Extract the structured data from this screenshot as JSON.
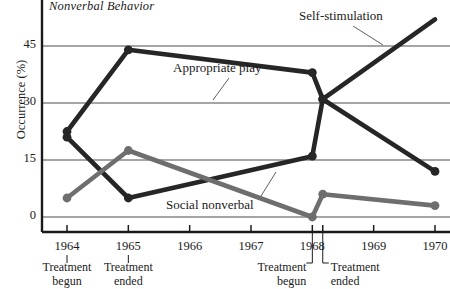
{
  "chart_data": {
    "type": "line",
    "title": "Nonverbal Behavior",
    "xlabel": "",
    "ylabel": "Occurrence (%)",
    "ylim": [
      0,
      52
    ],
    "yticks": [
      0,
      15,
      30,
      45
    ],
    "ytick_labels": [
      "0",
      "15",
      "30",
      "45"
    ],
    "xlim": [
      1963.6,
      1970.3
    ],
    "x": [
      1964,
      1965,
      1968,
      1968.17,
      1970
    ],
    "xticks": [
      1964,
      1965,
      1966,
      1967,
      1968,
      1968.17,
      1969,
      1970
    ],
    "xtick_labels": [
      "1964",
      "1965",
      "1966",
      "1967",
      "1968",
      "",
      "1969",
      "1970"
    ],
    "grid": true,
    "legend": "inline-annotations",
    "series": [
      {
        "name": "Appropriate play",
        "color": "#262626",
        "x": [
          1964,
          1965,
          1968,
          1968.17,
          1970
        ],
        "values": [
          22.5,
          44.0,
          38.0,
          31.0,
          12.0
        ],
        "label_x": 1966.0,
        "label_y": 41.0
      },
      {
        "name": "Self-stimulation",
        "color": "#262626",
        "x": [
          1964,
          1965,
          1968,
          1968.17,
          1970
        ],
        "values": [
          21.0,
          5.0,
          16.0,
          31.0,
          52.0
        ],
        "label_x": 1967.3,
        "label_y": 50.5
      },
      {
        "name": "Social nonverbal",
        "color": "#6e6e6e",
        "x": [
          1964,
          1965,
          1968,
          1968.17,
          1970
        ],
        "values": [
          5.0,
          17.5,
          0.0,
          6.0,
          3.0
        ],
        "label_x": 1965.8,
        "label_y": 4.0
      }
    ],
    "annotations": [
      {
        "at_x": 1964,
        "line1": "Treatment",
        "line2": "begun"
      },
      {
        "at_x": 1965,
        "line1": "Treatment",
        "line2": "ended"
      },
      {
        "at_x": 1968,
        "line1": "Treatment",
        "line2": "begun"
      },
      {
        "at_x": 1968.17,
        "line1": "Treatment",
        "line2": "ended"
      }
    ]
  },
  "labels": {
    "title": "Nonverbal Behavior",
    "y_axis": "Occurrence (%)",
    "ytick_0": "0",
    "ytick_15": "15",
    "ytick_30": "30",
    "ytick_45": "45",
    "xtick_1964": "1964",
    "xtick_1965": "1965",
    "xtick_1966": "1966",
    "xtick_1967": "1967",
    "xtick_1968": "1968",
    "xtick_1969": "1969",
    "xtick_1970": "1970",
    "series_appropriate_play": "Appropriate play",
    "series_self_stimulation": "Self-stimulation",
    "series_social_nonverbal": "Social nonverbal",
    "ann1_l1": "Treatment",
    "ann1_l2": "begun",
    "ann2_l1": "Treatment",
    "ann2_l2": "ended",
    "ann3_l1": "Treatment",
    "ann3_l2": "begun",
    "ann4_l1": "Treatment",
    "ann4_l2": "ended"
  }
}
